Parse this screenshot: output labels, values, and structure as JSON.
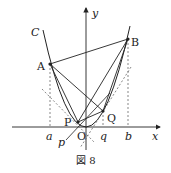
{
  "figure": {
    "caption": "図 8",
    "curve_label": "C",
    "axes": {
      "x_label": "x",
      "y_label": "y",
      "origin_label": "O"
    },
    "points": {
      "A": "A",
      "B": "B",
      "P": "P",
      "Q": "Q"
    },
    "tick_labels": {
      "a": "a",
      "p": "p",
      "q": "q",
      "b": "b"
    },
    "colors": {
      "stroke": "#222222",
      "dashed": "#555555",
      "background": "#ffffff"
    }
  }
}
